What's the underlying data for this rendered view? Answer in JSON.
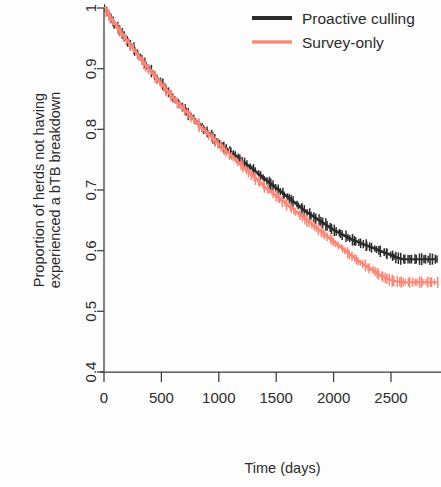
{
  "chart_data": {
    "type": "line",
    "title": "",
    "xlabel": "Time (days)",
    "ylabel_line1": "Proportion of herds not having",
    "ylabel_line2": "experienced a bTB breakdown",
    "xlim": [
      0,
      2900
    ],
    "ylim": [
      0.4,
      1.0
    ],
    "xticks": [
      0,
      500,
      1000,
      1500,
      2000,
      2500
    ],
    "xtick_labels": [
      "0",
      "500",
      "1000",
      "1500",
      "2000",
      "2500"
    ],
    "yticks": [
      0.4,
      0.5,
      0.6,
      0.7,
      0.8,
      0.9,
      1.0
    ],
    "ytick_labels": [
      "0.4",
      "0.5",
      "0.6",
      "0.7",
      "0.8",
      "0.9",
      "1"
    ],
    "grid": false,
    "legend_position": "top-right",
    "series": [
      {
        "name": "Proactive culling",
        "color": "#2b2b2b",
        "x": [
          0,
          40,
          80,
          120,
          160,
          200,
          240,
          280,
          320,
          360,
          400,
          440,
          480,
          520,
          560,
          600,
          640,
          680,
          720,
          760,
          800,
          840,
          880,
          920,
          960,
          1000,
          1040,
          1080,
          1120,
          1160,
          1200,
          1240,
          1280,
          1320,
          1360,
          1400,
          1440,
          1480,
          1520,
          1560,
          1600,
          1640,
          1680,
          1720,
          1760,
          1800,
          1840,
          1880,
          1920,
          1960,
          2000,
          2040,
          2080,
          2120,
          2160,
          2200,
          2240,
          2280,
          2320,
          2360,
          2400,
          2440,
          2480,
          2520,
          2560,
          2600,
          2650,
          2700,
          2750,
          2800,
          2860,
          2900
        ],
        "y": [
          1.0,
          0.988,
          0.977,
          0.967,
          0.957,
          0.947,
          0.937,
          0.927,
          0.917,
          0.907,
          0.898,
          0.889,
          0.88,
          0.871,
          0.862,
          0.853,
          0.845,
          0.837,
          0.829,
          0.821,
          0.813,
          0.806,
          0.799,
          0.792,
          0.785,
          0.778,
          0.772,
          0.766,
          0.76,
          0.754,
          0.748,
          0.742,
          0.736,
          0.73,
          0.724,
          0.718,
          0.712,
          0.706,
          0.7,
          0.694,
          0.688,
          0.682,
          0.676,
          0.67,
          0.664,
          0.659,
          0.654,
          0.649,
          0.644,
          0.639,
          0.634,
          0.63,
          0.626,
          0.622,
          0.618,
          0.615,
          0.612,
          0.609,
          0.606,
          0.603,
          0.6,
          0.597,
          0.594,
          0.591,
          0.588,
          0.586,
          0.586,
          0.586,
          0.586,
          0.586,
          0.586,
          0.586
        ]
      },
      {
        "name": "Survey-only",
        "color": "#f98878",
        "x": [
          0,
          40,
          80,
          120,
          160,
          200,
          240,
          280,
          320,
          360,
          400,
          440,
          480,
          520,
          560,
          600,
          640,
          680,
          720,
          760,
          800,
          840,
          880,
          920,
          960,
          1000,
          1040,
          1080,
          1120,
          1160,
          1200,
          1240,
          1280,
          1320,
          1360,
          1400,
          1440,
          1480,
          1520,
          1560,
          1600,
          1640,
          1680,
          1720,
          1760,
          1800,
          1840,
          1880,
          1920,
          1960,
          2000,
          2040,
          2080,
          2120,
          2160,
          2200,
          2240,
          2280,
          2320,
          2360,
          2400,
          2440,
          2480,
          2520,
          2560,
          2600,
          2650,
          2700,
          2750,
          2800,
          2860,
          2900
        ],
        "y": [
          1.0,
          0.988,
          0.977,
          0.966,
          0.956,
          0.946,
          0.936,
          0.926,
          0.916,
          0.906,
          0.897,
          0.888,
          0.879,
          0.87,
          0.861,
          0.852,
          0.844,
          0.836,
          0.828,
          0.82,
          0.812,
          0.804,
          0.797,
          0.79,
          0.783,
          0.775,
          0.768,
          0.761,
          0.754,
          0.747,
          0.74,
          0.733,
          0.726,
          0.719,
          0.712,
          0.705,
          0.699,
          0.693,
          0.687,
          0.681,
          0.675,
          0.669,
          0.663,
          0.657,
          0.651,
          0.645,
          0.639,
          0.633,
          0.627,
          0.621,
          0.615,
          0.609,
          0.603,
          0.597,
          0.591,
          0.585,
          0.58,
          0.575,
          0.57,
          0.565,
          0.56,
          0.556,
          0.553,
          0.55,
          0.549,
          0.548,
          0.548,
          0.548,
          0.548,
          0.548,
          0.548,
          0.548
        ]
      }
    ],
    "legend": [
      {
        "label": "Proactive culling",
        "color": "#2b2b2b"
      },
      {
        "label": "Survey-only",
        "color": "#f98878"
      }
    ]
  }
}
